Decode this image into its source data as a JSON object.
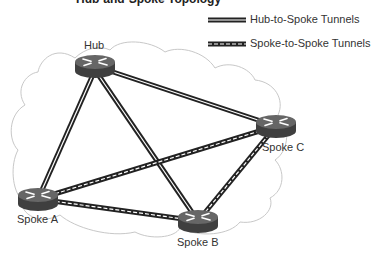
{
  "diagram": {
    "title": "Hub-and-Spoke Topology",
    "legend": [
      {
        "label": "Hub-to-Spoke Tunnels",
        "style": "solid-double"
      },
      {
        "label": "Spoke-to-Spoke Tunnels",
        "style": "dashed-double"
      }
    ],
    "nodes": [
      {
        "id": "hub",
        "label": "Hub",
        "type": "router",
        "x": 95,
        "y": 66
      },
      {
        "id": "spoke-a",
        "label": "Spoke A",
        "type": "router",
        "x": 38,
        "y": 199
      },
      {
        "id": "spoke-b",
        "label": "Spoke B",
        "type": "router",
        "x": 198,
        "y": 221
      },
      {
        "id": "spoke-c",
        "label": "Spoke C",
        "type": "router",
        "x": 276,
        "y": 126
      }
    ],
    "links": [
      {
        "from": "hub",
        "to": "spoke-a",
        "type": "hub-to-spoke"
      },
      {
        "from": "hub",
        "to": "spoke-b",
        "type": "hub-to-spoke"
      },
      {
        "from": "hub",
        "to": "spoke-c",
        "type": "hub-to-spoke"
      },
      {
        "from": "spoke-a",
        "to": "spoke-b",
        "type": "spoke-to-spoke"
      },
      {
        "from": "spoke-a",
        "to": "spoke-c",
        "type": "spoke-to-spoke"
      },
      {
        "from": "spoke-b",
        "to": "spoke-c",
        "type": "spoke-to-spoke"
      }
    ],
    "colors": {
      "router_body": "#4a4a4a",
      "router_top": "#6a6a6a",
      "tunnel": "#222222",
      "cloud_outline": "#c8c8c8",
      "text": "#333333"
    }
  }
}
